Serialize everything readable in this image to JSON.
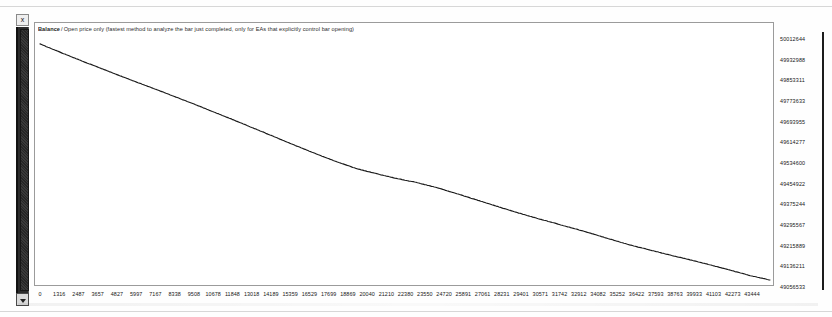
{
  "window": {
    "close_label": "x"
  },
  "chart": {
    "series_name": "Balance",
    "separator": "/",
    "subtitle": "Open price only (fastest method to analyze the bar just completed, only for EAs that explicitly control bar opening)",
    "line_color": "#1a1a1a",
    "background_color": "#ffffff",
    "axis_color": "#1c1c1c"
  },
  "chart_data": {
    "type": "line",
    "xlabel": "",
    "ylabel": "",
    "grid": false,
    "legend": "none",
    "series": [
      {
        "name": "Balance",
        "x": [
          0,
          1316,
          2487,
          3657,
          4827,
          5997,
          7167,
          8338,
          9508,
          10678,
          11848,
          13018,
          14189,
          15359,
          16529,
          17699,
          18869,
          20040,
          21210,
          22380,
          23550,
          24720,
          25891,
          27061,
          28231,
          29401,
          30571,
          31742,
          32912,
          34082,
          35252,
          36422,
          37593,
          38763,
          39933,
          41103,
          42273,
          43444
        ],
        "values": [
          50012644,
          49976000,
          49944000,
          49913000,
          49882000,
          49852000,
          49822000,
          49791000,
          49760000,
          49728000,
          49696000,
          49663000,
          49630000,
          49597000,
          49565000,
          49534600,
          49507000,
          49487000,
          49468000,
          49452000,
          49432000,
          49408000,
          49383000,
          49358000,
          49333000,
          49310000,
          49288000,
          49266000,
          49243000,
          49219000,
          49196000,
          49176000,
          49156000,
          49137000,
          49117000,
          49096000,
          49074000,
          49056533
        ]
      }
    ],
    "xticks": [
      0,
      1316,
      2487,
      3657,
      4827,
      5997,
      7167,
      8338,
      9508,
      10678,
      11848,
      13018,
      14189,
      15359,
      16529,
      17699,
      18869,
      20040,
      21210,
      22380,
      23550,
      24720,
      25891,
      27061,
      28231,
      29401,
      30571,
      31742,
      32912,
      34082,
      35252,
      36422,
      37593,
      38763,
      39933,
      41103,
      42273,
      43444
    ],
    "yticks": [
      50012644,
      49932988,
      49853311,
      49773633,
      49693955,
      49614277,
      49534600,
      49454922,
      49375244,
      49295567,
      49215889,
      49136211,
      49056533
    ],
    "ylim": [
      49056533,
      50012644
    ],
    "xlim": [
      0,
      43444
    ]
  }
}
